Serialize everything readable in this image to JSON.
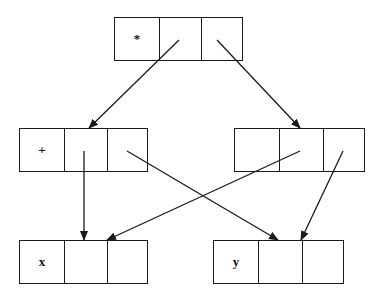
{
  "diagram": {
    "type": "expression-dag",
    "nodes": [
      {
        "id": "times",
        "label": "*",
        "x": 114,
        "y": 17,
        "width": 129,
        "cells": 3
      },
      {
        "id": "plus",
        "label": "+",
        "x": 19,
        "y": 128,
        "width": 129,
        "cells": 3
      },
      {
        "id": "blank",
        "label": "",
        "x": 234,
        "y": 128,
        "width": 131,
        "cells": 3
      },
      {
        "id": "x",
        "label": "x",
        "x": 19,
        "y": 240,
        "width": 129,
        "cells": 3
      },
      {
        "id": "y",
        "label": "y",
        "x": 213,
        "y": 240,
        "width": 131,
        "cells": 3
      }
    ],
    "edges": [
      {
        "from": "times",
        "from_cell": 2,
        "to": "plus",
        "x1": 179,
        "y1": 40,
        "x2": 89,
        "y2": 128
      },
      {
        "from": "times",
        "from_cell": 3,
        "to": "blank",
        "x1": 217,
        "y1": 40,
        "x2": 300,
        "y2": 128
      },
      {
        "from": "plus",
        "from_cell": 2,
        "to": "x",
        "x1": 84,
        "y1": 151,
        "x2": 84,
        "y2": 240
      },
      {
        "from": "plus",
        "from_cell": 3,
        "to": "y",
        "x1": 127,
        "y1": 151,
        "x2": 278,
        "y2": 240
      },
      {
        "from": "blank",
        "from_cell": 2,
        "to": "x",
        "x1": 300,
        "y1": 151,
        "x2": 107,
        "y2": 240
      },
      {
        "from": "blank",
        "from_cell": 3,
        "to": "y",
        "x1": 343,
        "y1": 151,
        "x2": 301,
        "y2": 240
      }
    ],
    "colors": {
      "stroke": "#1a1a1a",
      "background": "#ffffff"
    }
  }
}
